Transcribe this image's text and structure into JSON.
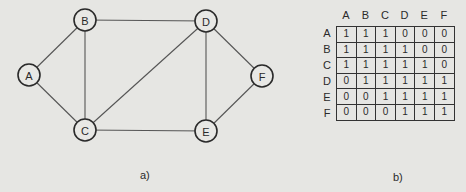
{
  "graph": {
    "caption": "a)",
    "nodes": [
      {
        "id": "A",
        "label": "A",
        "x": 29,
        "y": 75
      },
      {
        "id": "B",
        "label": "B",
        "x": 85,
        "y": 20
      },
      {
        "id": "C",
        "label": "C",
        "x": 85,
        "y": 130
      },
      {
        "id": "D",
        "label": "D",
        "x": 206,
        "y": 21
      },
      {
        "id": "E",
        "label": "E",
        "x": 206,
        "y": 131
      },
      {
        "id": "F",
        "label": "F",
        "x": 262,
        "y": 76
      }
    ],
    "edges": [
      [
        "A",
        "B"
      ],
      [
        "A",
        "C"
      ],
      [
        "B",
        "C"
      ],
      [
        "B",
        "D"
      ],
      [
        "C",
        "D"
      ],
      [
        "C",
        "E"
      ],
      [
        "D",
        "E"
      ],
      [
        "D",
        "F"
      ],
      [
        "E",
        "F"
      ]
    ],
    "node_radius": 11
  },
  "matrix": {
    "caption": "b)",
    "col_headers": [
      "A",
      "B",
      "C",
      "D",
      "E",
      "F"
    ],
    "row_headers": [
      "A",
      "B",
      "C",
      "D",
      "E",
      "F"
    ],
    "rows": [
      [
        "1",
        "1",
        "1",
        "0",
        "0",
        "0"
      ],
      [
        "1",
        "1",
        "1",
        "1",
        "0",
        "0"
      ],
      [
        "1",
        "1",
        "1",
        "1",
        "1",
        "0"
      ],
      [
        "0",
        "1",
        "1",
        "1",
        "1",
        "1"
      ],
      [
        "0",
        "0",
        "1",
        "1",
        "1",
        "1"
      ],
      [
        "0",
        "0",
        "0",
        "1",
        "1",
        "1"
      ]
    ]
  }
}
